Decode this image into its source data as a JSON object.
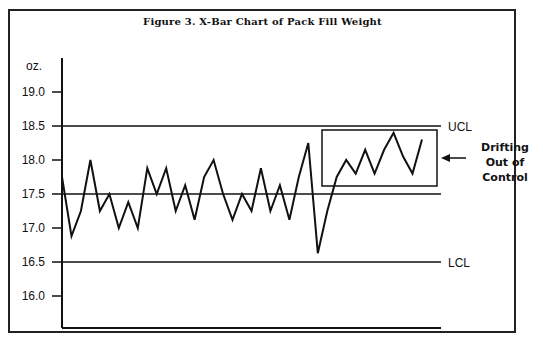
{
  "chart_data": {
    "type": "line",
    "title": "Figure 3. X-Bar Chart of Pack Fill Weight",
    "xlabel": "",
    "ylabel": "oz.",
    "yticks": [
      "19.0",
      "18.5",
      "18.0",
      "17.5",
      "17.0",
      "16.5",
      "16.0"
    ],
    "ylim": [
      15.6,
      19.4
    ],
    "grid": false,
    "reference_lines": [
      {
        "name": "UCL",
        "value": 18.5
      },
      {
        "name": "Center",
        "value": 17.5
      },
      {
        "name": "LCL",
        "value": 16.5
      }
    ],
    "series": [
      {
        "name": "X-Bar",
        "values": [
          17.75,
          16.88,
          17.25,
          18.0,
          17.25,
          17.5,
          17.0,
          17.38,
          17.0,
          17.88,
          17.5,
          17.88,
          17.25,
          17.63,
          17.12,
          17.75,
          18.0,
          17.5,
          17.12,
          17.5,
          17.25,
          17.88,
          17.25,
          17.63,
          17.12,
          17.75,
          18.25,
          16.63,
          17.25,
          17.75,
          18.0,
          17.8,
          18.15,
          17.8,
          18.15,
          18.4,
          18.05,
          17.8,
          18.3
        ]
      }
    ],
    "annotations": [
      {
        "text": "Drifting Out of Control",
        "target": "last 10 points (boxed)",
        "arrow": "left"
      }
    ]
  },
  "labels": {
    "title": "Figure 3. X-Bar Chart of Pack Fill Weight",
    "units": "oz.",
    "ucl": "UCL",
    "lcl": "LCL",
    "annotation_line1": "Drifting",
    "annotation_line2": "Out of",
    "annotation_line3": "Control",
    "ticks": [
      "19.0",
      "18.5",
      "18.0",
      "17.5",
      "17.0",
      "16.5",
      "16.0"
    ]
  }
}
